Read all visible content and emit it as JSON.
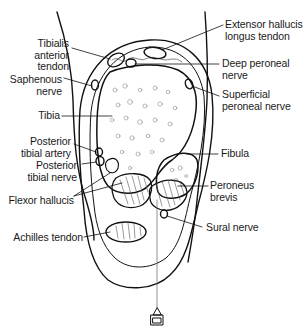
{
  "figure": {
    "colors": {
      "line": "#111111",
      "background": "#ffffff",
      "label_text": "#1a1a1a"
    }
  },
  "labels": {
    "tibialis_anterior_tendon": "Tibialis\nanterior\ntendon",
    "saphenous_nerve": "Saphenous\nnerve",
    "tibia": "Tibia",
    "posterior_tibial_artery": "Posterior\ntibial artery",
    "posterior_tibial_nerve": "Posterior\ntibial nerve",
    "flexor_hallucis": "Flexor hallucis",
    "achilles_tendon": "Achilles tendon",
    "extensor_hallucis_longus_tendon": "Extensor hallucis\nlongus tendon",
    "deep_peroneal_nerve": "Deep peroneal\nnerve",
    "superficial_peroneal_nerve": "Superficial\nperoneal nerve",
    "fibula": "Fibula",
    "peroneus_brevis": "Peroneus\nbrevis",
    "sural_nerve": "Sural nerve"
  }
}
